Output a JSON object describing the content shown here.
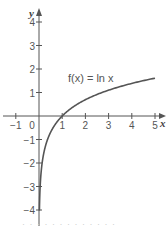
{
  "chart_data": {
    "type": "line",
    "title": "",
    "function_label": "f(x) = ln x",
    "xlabel": "x",
    "ylabel": "y",
    "xlim": [
      -1.5,
      5.5
    ],
    "ylim": [
      -4.5,
      4.5
    ],
    "x_ticks": [
      -1,
      0,
      1,
      2,
      3,
      4,
      5
    ],
    "x_tick_labels": [
      "−1",
      "0",
      "1",
      "2",
      "3",
      "4",
      "5"
    ],
    "y_ticks": [
      -4,
      -3,
      -2,
      -1,
      1,
      2,
      3,
      4
    ],
    "y_tick_labels": [
      "−4",
      "−3",
      "−2",
      "−1",
      "1",
      "2",
      "3",
      "4"
    ],
    "grid": false,
    "series": [
      {
        "name": "f(x) = ln x",
        "x": [
          0.018,
          0.05,
          0.1,
          0.2,
          0.3,
          0.5,
          0.75,
          1,
          1.5,
          2,
          2.5,
          3,
          3.5,
          4,
          4.5,
          5
        ],
        "y": [
          -4.0,
          -3.0,
          -2.3,
          -1.61,
          -1.2,
          -0.69,
          -0.29,
          0,
          0.41,
          0.69,
          0.92,
          1.1,
          1.25,
          1.39,
          1.5,
          1.61
        ],
        "color": "#555555"
      }
    ],
    "colors": {
      "axis": "#555555",
      "curve": "#555555",
      "text": "#555555"
    }
  },
  "caption": "· · · · · · · · · · · · ·"
}
